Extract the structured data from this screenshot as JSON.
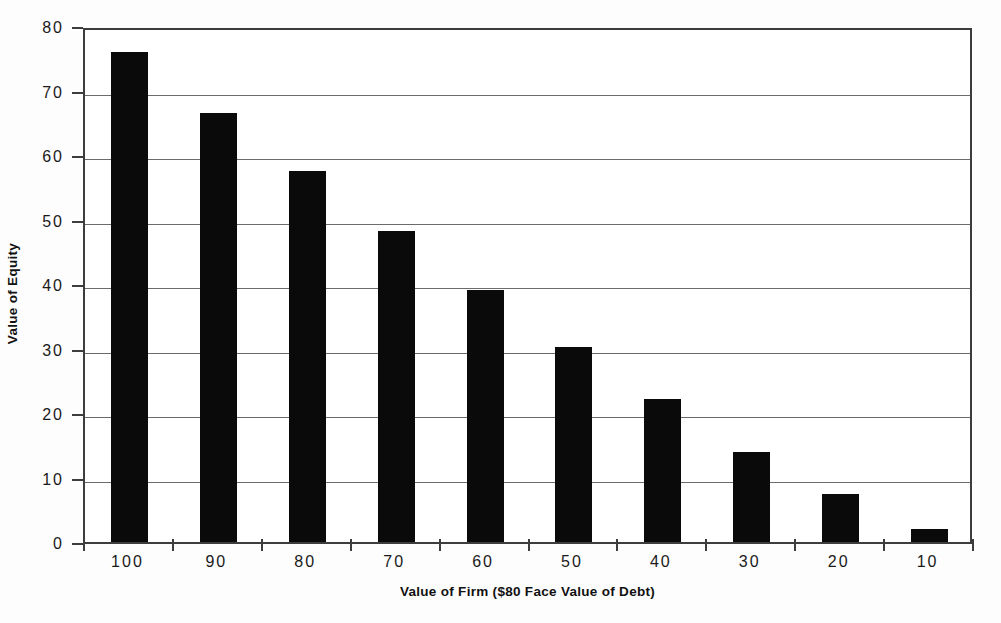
{
  "chart_data": {
    "type": "bar",
    "title": "",
    "subtitle": "",
    "xlabel": "Value of Firm ($80 Face Value of Debt)",
    "ylabel": "Value of Equity",
    "categories": [
      "100",
      "90",
      "80",
      "70",
      "60",
      "50",
      "40",
      "30",
      "20",
      "10"
    ],
    "values": [
      76.0,
      66.5,
      57.5,
      48.2,
      39.0,
      30.3,
      22.2,
      14.0,
      7.5,
      2.0
    ],
    "series": [
      {
        "name": "Value of Equity",
        "values": [
          76.0,
          66.5,
          57.5,
          48.2,
          39.0,
          30.3,
          22.2,
          14.0,
          7.5,
          2.0
        ]
      }
    ],
    "ylim": [
      0,
      80
    ],
    "y_ticks": [
      0,
      10,
      20,
      30,
      40,
      50,
      60,
      70,
      80
    ],
    "y_tick_labels": [
      "0",
      "10",
      "20",
      "30",
      "40",
      "50",
      "60",
      "70",
      "80"
    ],
    "grid": true,
    "grid_axis": "y",
    "legend": false,
    "legend_position": "none",
    "bar_color": "#0a0a0a",
    "grid_color": "#6b6b6b",
    "axis_color": "#3d3d3d",
    "background_color": "#ffffff",
    "annotations": []
  }
}
